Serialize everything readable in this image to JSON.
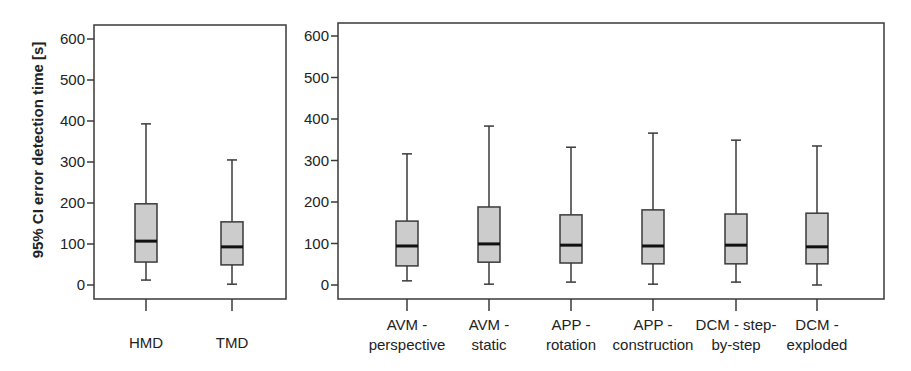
{
  "chart_data": {
    "type": "boxplot",
    "ylabel": "95% CI error detection time [s]",
    "ylim": [
      0,
      600
    ],
    "yticks": [
      0,
      100,
      200,
      300,
      400,
      500,
      600
    ],
    "grid": false,
    "panels": [
      {
        "name": "display-type",
        "categories": [
          {
            "label_lines": [
              "HMD"
            ],
            "whisker_low": 12,
            "q1": 56,
            "median": 107,
            "q3": 198,
            "whisker_high": 393
          },
          {
            "label_lines": [
              "TMD"
            ],
            "whisker_low": 2,
            "q1": 49,
            "median": 93,
            "q3": 154,
            "whisker_high": 305
          }
        ]
      },
      {
        "name": "visualization-method",
        "categories": [
          {
            "label_lines": [
              "AVM -",
              "perspective"
            ],
            "whisker_low": 10,
            "q1": 46,
            "median": 94,
            "q3": 154,
            "whisker_high": 316
          },
          {
            "label_lines": [
              "AVM -",
              "static"
            ],
            "whisker_low": 2,
            "q1": 55,
            "median": 99,
            "q3": 188,
            "whisker_high": 383
          },
          {
            "label_lines": [
              "APP -",
              "rotation"
            ],
            "whisker_low": 7,
            "q1": 53,
            "median": 96,
            "q3": 169,
            "whisker_high": 332
          },
          {
            "label_lines": [
              "APP -",
              "construction"
            ],
            "whisker_low": 2,
            "q1": 51,
            "median": 94,
            "q3": 181,
            "whisker_high": 366
          },
          {
            "label_lines": [
              "DCM - step-",
              "by-step"
            ],
            "whisker_low": 7,
            "q1": 51,
            "median": 96,
            "q3": 171,
            "whisker_high": 349
          },
          {
            "label_lines": [
              "DCM -",
              "exploded"
            ],
            "whisker_low": 0,
            "q1": 51,
            "median": 92,
            "q3": 173,
            "whisker_high": 335
          }
        ]
      }
    ]
  },
  "colors": {
    "box_fill": "#cccccc",
    "box_stroke": "#3a3a3a",
    "median": "#111111",
    "axis": "#3a3a3a",
    "text": "#222222"
  }
}
